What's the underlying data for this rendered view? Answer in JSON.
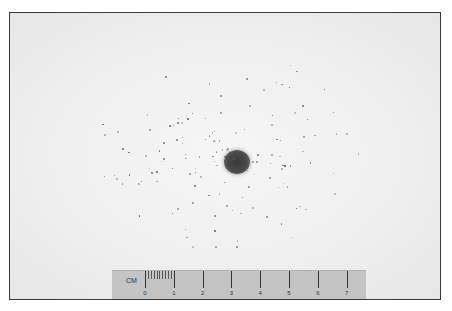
{
  "image": {
    "description": "Photograph of a bullet hole in white paper surrounded by scattered particle residue, with a centimeter scale ruler at the bottom",
    "background_color": "#eeeeee",
    "border_color": "#3a3a3a",
    "hole_color": "#404040"
  },
  "ruler": {
    "unit_label": "CM",
    "tick_labels": [
      "0",
      "1",
      "2",
      "3",
      "4",
      "5",
      "6",
      "7"
    ],
    "color": "#c4c4c4"
  }
}
